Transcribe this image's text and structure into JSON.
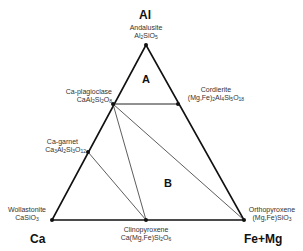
{
  "vertices": {
    "top": "Al",
    "left": "Ca",
    "right": "Fe+Mg"
  },
  "fields": {
    "a": "A",
    "b": "B"
  },
  "minerals": [
    {
      "name": "Andalusite",
      "formula": [
        "Al",
        "2",
        "SiO",
        "5"
      ],
      "x": 146,
      "y": 45
    },
    {
      "name": "Ca-plagioclase",
      "formula": [
        "CaAl",
        "2",
        "Si",
        "2",
        "O",
        "8"
      ],
      "x": 113,
      "y": 104
    },
    {
      "name": "Cordierite",
      "formula": [
        "(Mg,Fe)",
        "2",
        "Al",
        "4",
        "Si",
        "5",
        "O",
        "18"
      ],
      "x": 178,
      "y": 104
    },
    {
      "name": "Ca-garnet",
      "formula": [
        "Ca",
        "3",
        "Al",
        "2",
        "Si",
        "3",
        "O",
        "12"
      ],
      "x": 88,
      "y": 152
    },
    {
      "name": "Wollastonite",
      "formula": [
        "CaSiO",
        "3"
      ],
      "x": 52,
      "y": 220
    },
    {
      "name": "Clinopyroxene",
      "formula": [
        "Ca(Mg,Fe)Si",
        "2",
        "O",
        "6"
      ],
      "x": 146,
      "y": 220
    },
    {
      "name": "Orthopyroxene",
      "formula": [
        "(Mg,Fe)SiO",
        "3"
      ],
      "x": 244,
      "y": 220
    }
  ],
  "tie_lines": [
    [
      "Ca-plagioclase",
      "Cordierite"
    ],
    [
      "Ca-plagioclase",
      "Clinopyroxene"
    ],
    [
      "Ca-plagioclase",
      "Orthopyroxene"
    ],
    [
      "Ca-garnet",
      "Clinopyroxene"
    ]
  ]
}
